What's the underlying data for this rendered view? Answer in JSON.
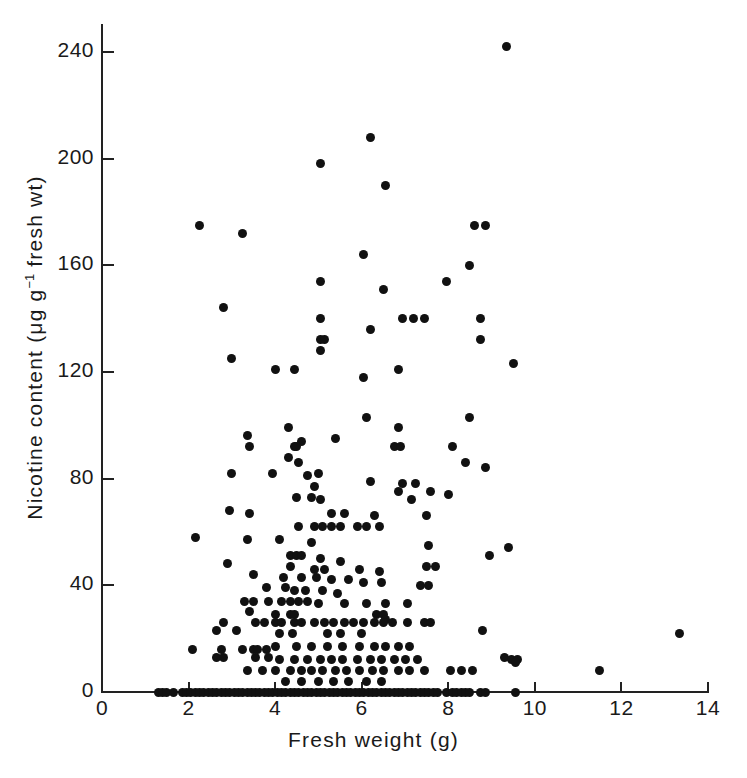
{
  "chart_data": {
    "type": "scatter",
    "title": "",
    "xlabel": "Fresh  weight  (g)",
    "ylabel_text": "Nicotine content  (μg g",
    "ylabel_sup": "−1",
    "ylabel_tail": " fresh wt)",
    "ylabel_plain": "Nicotine content (μg g⁻¹ fresh wt)",
    "xlim": [
      0,
      14
    ],
    "ylim": [
      0,
      250
    ],
    "xticks": [
      0,
      2,
      4,
      6,
      8,
      10,
      12,
      14
    ],
    "xticklabels": [
      "0",
      "2",
      "4",
      "6",
      "8",
      "10",
      "12",
      "14"
    ],
    "yticks": [
      0,
      40,
      80,
      120,
      160,
      200,
      240
    ],
    "yticklabels": [
      "0",
      "40",
      "80",
      "120",
      "160",
      "200",
      "240"
    ],
    "grid": false,
    "legend": false,
    "marker": "filled-circle",
    "marker_color": "#111111",
    "marker_size_px": 9,
    "n_points": 431,
    "points": [
      [
        9.35,
        242
      ],
      [
        6.2,
        208
      ],
      [
        5.05,
        198
      ],
      [
        6.55,
        190
      ],
      [
        2.25,
        175
      ],
      [
        8.6,
        175
      ],
      [
        8.85,
        175
      ],
      [
        3.25,
        172
      ],
      [
        6.05,
        164
      ],
      [
        8.5,
        160
      ],
      [
        7.95,
        154
      ],
      [
        5.05,
        154
      ],
      [
        6.5,
        151
      ],
      [
        2.8,
        144
      ],
      [
        6.95,
        140
      ],
      [
        7.2,
        140
      ],
      [
        5.05,
        140
      ],
      [
        8.75,
        140
      ],
      [
        7.45,
        140
      ],
      [
        6.2,
        136
      ],
      [
        5.05,
        132
      ],
      [
        5.15,
        132
      ],
      [
        8.75,
        132
      ],
      [
        5.05,
        128
      ],
      [
        6.05,
        118
      ],
      [
        9.5,
        123
      ],
      [
        3.0,
        125
      ],
      [
        4.0,
        121
      ],
      [
        4.45,
        121
      ],
      [
        6.85,
        121
      ],
      [
        6.1,
        103
      ],
      [
        8.5,
        103
      ],
      [
        4.3,
        99
      ],
      [
        6.85,
        99
      ],
      [
        3.35,
        96
      ],
      [
        5.4,
        95
      ],
      [
        4.6,
        94
      ],
      [
        8.1,
        92
      ],
      [
        3.4,
        92
      ],
      [
        4.45,
        92
      ],
      [
        4.5,
        92
      ],
      [
        6.75,
        92
      ],
      [
        6.9,
        92
      ],
      [
        4.3,
        88
      ],
      [
        4.55,
        86
      ],
      [
        8.4,
        86
      ],
      [
        8.85,
        84
      ],
      [
        3.0,
        82
      ],
      [
        3.95,
        82
      ],
      [
        5.0,
        82
      ],
      [
        4.75,
        81
      ],
      [
        6.2,
        79
      ],
      [
        6.95,
        78
      ],
      [
        7.25,
        78
      ],
      [
        4.9,
        77
      ],
      [
        6.85,
        75
      ],
      [
        7.6,
        75
      ],
      [
        8.0,
        74
      ],
      [
        4.5,
        73
      ],
      [
        4.85,
        73
      ],
      [
        5.05,
        72
      ],
      [
        7.15,
        72
      ],
      [
        2.95,
        68
      ],
      [
        3.4,
        67
      ],
      [
        5.3,
        67
      ],
      [
        5.6,
        67
      ],
      [
        6.3,
        66
      ],
      [
        7.5,
        66
      ],
      [
        4.55,
        62
      ],
      [
        4.9,
        62
      ],
      [
        5.1,
        62
      ],
      [
        5.3,
        62
      ],
      [
        5.5,
        62
      ],
      [
        5.9,
        62
      ],
      [
        6.1,
        62
      ],
      [
        6.4,
        62
      ],
      [
        2.15,
        58
      ],
      [
        3.35,
        57
      ],
      [
        4.1,
        57
      ],
      [
        4.85,
        56
      ],
      [
        7.55,
        55
      ],
      [
        9.4,
        54
      ],
      [
        4.35,
        51
      ],
      [
        4.5,
        51
      ],
      [
        4.6,
        51
      ],
      [
        5.05,
        50
      ],
      [
        5.5,
        49
      ],
      [
        8.95,
        51
      ],
      [
        2.9,
        48
      ],
      [
        7.5,
        47
      ],
      [
        7.7,
        47
      ],
      [
        4.35,
        47
      ],
      [
        4.9,
        46
      ],
      [
        5.15,
        46
      ],
      [
        5.95,
        46
      ],
      [
        6.4,
        45
      ],
      [
        3.5,
        44
      ],
      [
        4.2,
        43
      ],
      [
        4.6,
        43
      ],
      [
        4.95,
        43
      ],
      [
        5.3,
        42
      ],
      [
        5.7,
        42
      ],
      [
        6.05,
        41
      ],
      [
        6.45,
        41
      ],
      [
        7.35,
        40
      ],
      [
        7.55,
        40
      ],
      [
        3.8,
        39
      ],
      [
        4.25,
        39
      ],
      [
        4.45,
        38
      ],
      [
        4.7,
        38
      ],
      [
        5.1,
        38
      ],
      [
        5.45,
        37
      ],
      [
        3.3,
        34
      ],
      [
        3.5,
        34
      ],
      [
        3.85,
        34
      ],
      [
        4.15,
        34
      ],
      [
        4.35,
        34
      ],
      [
        4.55,
        34
      ],
      [
        4.75,
        34
      ],
      [
        5.0,
        33
      ],
      [
        5.6,
        33
      ],
      [
        6.1,
        33
      ],
      [
        6.55,
        33
      ],
      [
        7.05,
        33
      ],
      [
        3.4,
        30
      ],
      [
        4.0,
        29
      ],
      [
        4.35,
        29
      ],
      [
        4.45,
        29
      ],
      [
        6.35,
        29
      ],
      [
        6.5,
        29
      ],
      [
        6.55,
        27
      ],
      [
        2.8,
        26
      ],
      [
        3.55,
        26
      ],
      [
        3.75,
        26
      ],
      [
        4.0,
        26
      ],
      [
        4.15,
        26
      ],
      [
        4.45,
        26
      ],
      [
        4.6,
        26
      ],
      [
        4.9,
        26
      ],
      [
        5.15,
        26
      ],
      [
        5.35,
        26
      ],
      [
        5.6,
        26
      ],
      [
        5.8,
        26
      ],
      [
        6.05,
        26
      ],
      [
        6.3,
        26
      ],
      [
        6.5,
        26
      ],
      [
        6.7,
        26
      ],
      [
        7.05,
        26
      ],
      [
        7.45,
        26
      ],
      [
        7.6,
        26
      ],
      [
        2.65,
        23
      ],
      [
        3.1,
        23
      ],
      [
        4.1,
        22
      ],
      [
        4.4,
        22
      ],
      [
        5.2,
        22
      ],
      [
        5.5,
        22
      ],
      [
        6.0,
        22
      ],
      [
        8.8,
        23
      ],
      [
        13.35,
        22
      ],
      [
        2.1,
        16
      ],
      [
        2.75,
        16
      ],
      [
        3.25,
        16
      ],
      [
        3.5,
        16
      ],
      [
        3.6,
        16
      ],
      [
        3.8,
        16
      ],
      [
        4.0,
        17
      ],
      [
        4.5,
        17
      ],
      [
        4.85,
        17
      ],
      [
        5.2,
        17
      ],
      [
        5.55,
        17
      ],
      [
        5.95,
        17
      ],
      [
        6.3,
        17
      ],
      [
        6.55,
        17
      ],
      [
        6.85,
        17
      ],
      [
        7.1,
        17
      ],
      [
        2.65,
        13
      ],
      [
        2.8,
        13
      ],
      [
        3.55,
        13
      ],
      [
        3.85,
        13
      ],
      [
        4.1,
        12
      ],
      [
        4.45,
        12
      ],
      [
        4.75,
        12
      ],
      [
        5.05,
        12
      ],
      [
        5.3,
        12
      ],
      [
        5.55,
        12
      ],
      [
        5.9,
        12
      ],
      [
        6.2,
        12
      ],
      [
        6.45,
        12
      ],
      [
        6.75,
        12
      ],
      [
        7.0,
        12
      ],
      [
        7.3,
        12
      ],
      [
        9.3,
        13
      ],
      [
        9.45,
        12
      ],
      [
        9.6,
        12
      ],
      [
        9.55,
        11
      ],
      [
        11.5,
        8
      ],
      [
        3.35,
        8
      ],
      [
        3.7,
        8
      ],
      [
        4.0,
        8
      ],
      [
        4.35,
        8
      ],
      [
        4.6,
        8
      ],
      [
        4.85,
        8
      ],
      [
        5.1,
        8
      ],
      [
        5.4,
        8
      ],
      [
        5.65,
        8
      ],
      [
        5.95,
        8
      ],
      [
        6.25,
        8
      ],
      [
        6.5,
        8
      ],
      [
        6.85,
        8
      ],
      [
        7.1,
        8
      ],
      [
        7.45,
        8
      ],
      [
        8.3,
        8
      ],
      [
        8.55,
        8
      ],
      [
        8.05,
        8
      ],
      [
        4.25,
        4
      ],
      [
        4.6,
        4
      ],
      [
        5.0,
        4
      ],
      [
        5.35,
        4
      ],
      [
        5.7,
        4
      ],
      [
        6.1,
        4
      ],
      [
        6.45,
        4
      ],
      [
        1.3,
        0
      ],
      [
        1.4,
        0
      ],
      [
        1.5,
        0
      ],
      [
        1.65,
        0
      ],
      [
        1.85,
        0
      ],
      [
        1.95,
        0
      ],
      [
        2.05,
        0
      ],
      [
        2.15,
        0
      ],
      [
        2.25,
        0
      ],
      [
        2.35,
        0
      ],
      [
        2.45,
        0
      ],
      [
        2.55,
        0
      ],
      [
        2.65,
        0
      ],
      [
        2.75,
        0
      ],
      [
        2.85,
        0
      ],
      [
        2.95,
        0
      ],
      [
        3.05,
        0
      ],
      [
        3.15,
        0
      ],
      [
        3.25,
        0
      ],
      [
        3.35,
        0
      ],
      [
        3.45,
        0
      ],
      [
        3.55,
        0
      ],
      [
        3.65,
        0
      ],
      [
        3.75,
        0
      ],
      [
        3.85,
        0
      ],
      [
        3.95,
        0
      ],
      [
        4.05,
        0
      ],
      [
        4.15,
        0
      ],
      [
        4.25,
        0
      ],
      [
        4.35,
        0
      ],
      [
        4.45,
        0
      ],
      [
        4.55,
        0
      ],
      [
        4.65,
        0
      ],
      [
        4.75,
        0
      ],
      [
        4.85,
        0
      ],
      [
        4.95,
        0
      ],
      [
        5.05,
        0
      ],
      [
        5.15,
        0
      ],
      [
        5.25,
        0
      ],
      [
        5.35,
        0
      ],
      [
        5.45,
        0
      ],
      [
        5.55,
        0
      ],
      [
        5.65,
        0
      ],
      [
        5.75,
        0
      ],
      [
        5.85,
        0
      ],
      [
        5.95,
        0
      ],
      [
        6.05,
        0
      ],
      [
        6.15,
        0
      ],
      [
        6.25,
        0
      ],
      [
        6.35,
        0
      ],
      [
        6.45,
        0
      ],
      [
        6.55,
        0
      ],
      [
        6.65,
        0
      ],
      [
        6.75,
        0
      ],
      [
        6.85,
        0
      ],
      [
        6.95,
        0
      ],
      [
        7.05,
        0
      ],
      [
        7.15,
        0
      ],
      [
        7.25,
        0
      ],
      [
        7.35,
        0
      ],
      [
        7.45,
        0
      ],
      [
        7.55,
        0
      ],
      [
        7.65,
        0
      ],
      [
        7.75,
        0
      ],
      [
        7.95,
        0
      ],
      [
        8.1,
        0
      ],
      [
        8.2,
        0
      ],
      [
        8.3,
        0
      ],
      [
        8.4,
        0
      ],
      [
        8.5,
        0
      ],
      [
        8.75,
        0
      ],
      [
        8.85,
        0
      ],
      [
        9.55,
        0
      ]
    ]
  },
  "figure": {
    "background_color": "#ffffff",
    "axis_color": "#222222",
    "text_color": "#1a1a1a"
  }
}
